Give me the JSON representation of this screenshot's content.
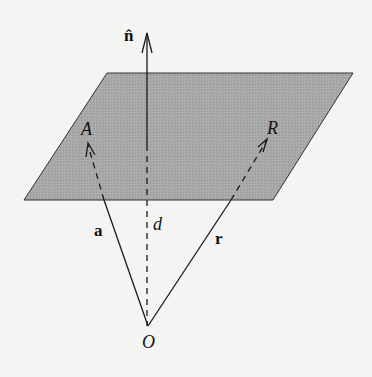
{
  "figure": {
    "colors": {
      "background": "#f4f4f2",
      "plane_fill": "#a9a9a9",
      "plane_edge": "#333333",
      "line": "#1a1a1a"
    },
    "plane": {
      "corners": [
        [
          107,
          73
        ],
        [
          353,
          73
        ],
        [
          273,
          200
        ],
        [
          24,
          200
        ]
      ]
    },
    "labels": {
      "normal": "n̂",
      "point_A": "A",
      "point_R": "R",
      "distance": "d",
      "vector_a": "a",
      "vector_r": "r",
      "origin": "O"
    }
  }
}
